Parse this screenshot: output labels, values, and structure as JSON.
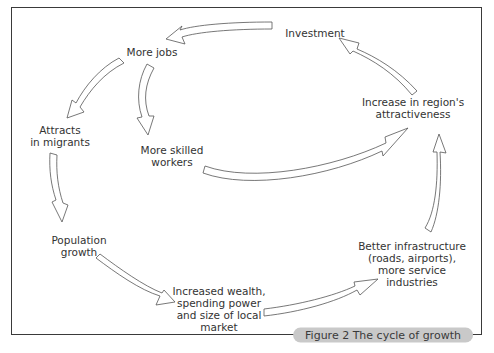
{
  "diagram": {
    "nodes": {
      "investment": "Investment",
      "more_jobs": "More jobs",
      "attracts_migrants_1": "Attracts",
      "attracts_migrants_2": "in migrants",
      "skilled_1": "More skilled",
      "skilled_2": "workers",
      "population_1": "Population",
      "population_2": "growth",
      "wealth_1": "Increased wealth,",
      "wealth_2": "spending power",
      "wealth_3": "and size of local",
      "wealth_4": "market",
      "infra_1": "Better infrastructure",
      "infra_2": "(roads, airports),",
      "infra_3": "more service",
      "infra_4": "industries",
      "attract_1": "Increase in region's",
      "attract_2": "attractiveness"
    },
    "caption": "Figure 2  The cycle of growth",
    "edges": [
      {
        "from": "Investment",
        "to": "More jobs"
      },
      {
        "from": "More jobs",
        "to": "Attracts in migrants"
      },
      {
        "from": "More jobs",
        "to": "More skilled workers"
      },
      {
        "from": "Attracts in migrants",
        "to": "Population growth"
      },
      {
        "from": "Population growth",
        "to": "Increased wealth, spending power and size of local market"
      },
      {
        "from": "Increased wealth, spending power and size of local market",
        "to": "Better infrastructure (roads, airports), more service industries"
      },
      {
        "from": "Better infrastructure (roads, airports), more service industries",
        "to": "Increase in region's attractiveness"
      },
      {
        "from": "More skilled workers",
        "to": "Increase in region's attractiveness"
      },
      {
        "from": "Increase in region's attractiveness",
        "to": "Investment"
      }
    ]
  }
}
